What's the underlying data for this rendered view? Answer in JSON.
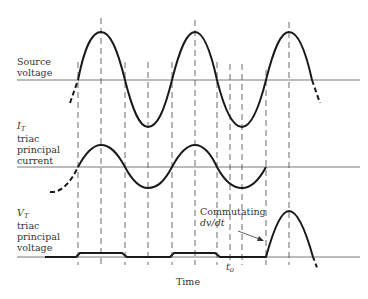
{
  "diagram": {
    "type": "waveform-timing",
    "x_axis_label": "Time",
    "traces": [
      {
        "id": "source-voltage",
        "label_lines": [
          "Source",
          "voltage"
        ]
      },
      {
        "id": "triac-current",
        "symbol": "I",
        "subscript": "T",
        "label_lines": [
          "triac",
          "principal",
          "current"
        ]
      },
      {
        "id": "triac-voltage",
        "symbol": "V",
        "subscript": "T",
        "label_lines": [
          "triac",
          "principal",
          "voltage"
        ]
      }
    ],
    "annotations": {
      "commutating_line1": "Commutating",
      "commutating_line2": "dv/dt",
      "t0_symbol": "t",
      "t0_subscript": "o"
    },
    "colors": {
      "ink": "#1a1a1a",
      "axis": "#555555",
      "text": "#333333"
    }
  }
}
